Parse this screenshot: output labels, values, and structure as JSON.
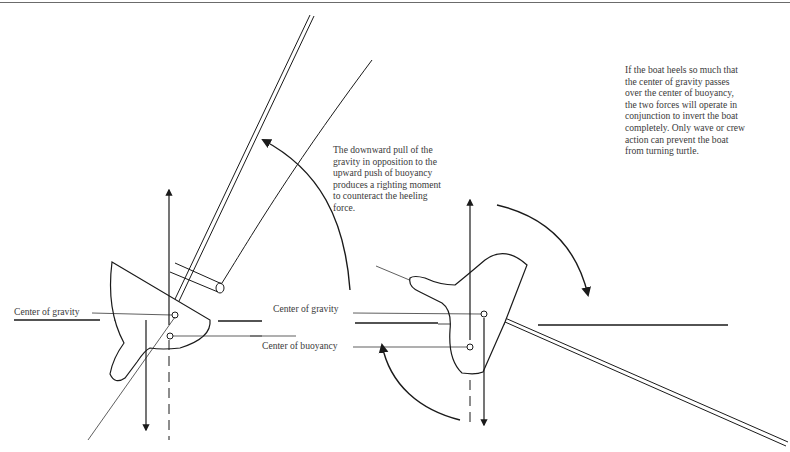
{
  "captions": {
    "righting_moment": "The downward pull of the\ngravity in opposition to the\nupward push of buoyancy\nproduces a righting moment\nto counteract the heeling\nforce.",
    "capsize": "If the boat heels so much that\nthe center of gravity passes\nover the center of buoyancy,\nthe two forces will operate in\nconjunction to invert the boat\ncompletely. Only wave or crew\naction can prevent the boat\nfrom turning turtle."
  },
  "labels": {
    "left_center_of_gravity": "Center of gravity",
    "right_center_of_gravity": "Center of gravity",
    "right_center_of_buoyancy": "Center of buoyancy"
  },
  "figures": [
    {
      "name": "heeled-boat-righting",
      "mast_direction": "up-right",
      "rotation_arrow": "counter-clockwise (righting)"
    },
    {
      "name": "heeled-boat-capsizing",
      "mast_direction": "down-right",
      "rotation_arrow": "clockwise (capsizing)"
    }
  ],
  "colors": {
    "ink": "#1a1a1a",
    "text": "#3a3a3a",
    "rule": "#6b6b6b"
  }
}
